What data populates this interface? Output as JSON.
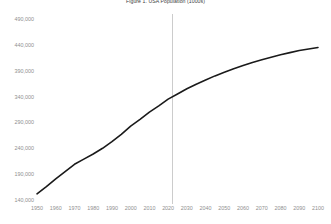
{
  "chart_data": {
    "type": "line",
    "title": "Figure 1. USA Population (1000s)",
    "xlabel": "",
    "ylabel": "",
    "xlim": [
      1950,
      2100
    ],
    "ylim": [
      140000,
      490000
    ],
    "grid": false,
    "legend": null,
    "xticks": [
      1950,
      1960,
      1970,
      1980,
      1990,
      2000,
      2010,
      2020,
      2030,
      2040,
      2050,
      2060,
      2070,
      2080,
      2090,
      2100
    ],
    "yticks": [
      140000,
      190000,
      240000,
      290000,
      340000,
      390000,
      440000,
      490000
    ],
    "ytick_labels": [
      "140,000",
      "190,000",
      "240,000",
      "290,000",
      "340,000",
      "390,000",
      "440,000",
      "490,000"
    ],
    "xtick_labels": [
      "1950",
      "1960",
      "1970",
      "1980",
      "1990",
      "2000",
      "2010",
      "2020",
      "2030",
      "2040",
      "2050",
      "2060",
      "2070",
      "2080",
      "2090",
      "2100"
    ],
    "annotations": [
      {
        "name": "present-year-reference-line",
        "type": "vline",
        "x": 2022,
        "color": "#cccccc"
      }
    ],
    "series": [
      {
        "name": "USA Population",
        "color": "#1a1a1a",
        "x": [
          1950,
          1955,
          1960,
          1965,
          1970,
          1975,
          1980,
          1985,
          1990,
          1995,
          2000,
          2005,
          2010,
          2015,
          2020,
          2025,
          2030,
          2035,
          2040,
          2045,
          2050,
          2055,
          2060,
          2065,
          2070,
          2075,
          2080,
          2085,
          2090,
          2095,
          2100
        ],
        "values": [
          152000,
          166000,
          181000,
          195000,
          209000,
          219000,
          229000,
          240000,
          253000,
          267000,
          283000,
          296000,
          310000,
          322000,
          335000,
          345000,
          355000,
          364000,
          372000,
          380000,
          387000,
          394000,
          400000,
          406000,
          411000,
          416000,
          421000,
          425000,
          429000,
          432000,
          435000
        ]
      }
    ]
  }
}
